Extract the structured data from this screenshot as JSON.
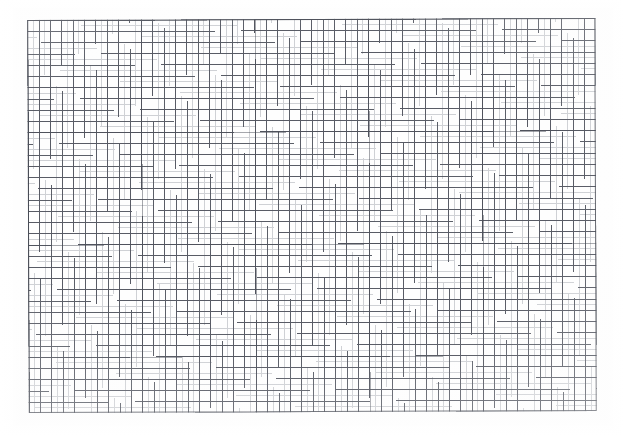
{
  "document": {
    "type": "graph-paper",
    "title": "Blank Graph Paper Sheet",
    "background_color": "#fefefe",
    "has_text": false,
    "has_labels": false,
    "has_annotations": false
  },
  "grid": {
    "name": "plotting-grid",
    "left_px": 28,
    "top_px": 19,
    "width_px": 568,
    "height_px": 393,
    "columns": 50,
    "rows": 35,
    "cell_width_px": 11.36,
    "cell_height_px": 11.23,
    "subdivisions_per_cell": 2,
    "major_every_n_cells": 10,
    "line_color": "#4e525c",
    "minor_line_color": "#787d87",
    "border_color": "#464a54",
    "line_width_px": 0.9,
    "minor_line_width_px": 0.6,
    "border_width_px": 1
  },
  "chart_data": {
    "type": "table",
    "title": "",
    "xlabel": "",
    "ylabel": "",
    "categories": [],
    "values": [],
    "series": [],
    "grid": true,
    "legend": false,
    "annotations": [],
    "note": "Empty grid — no plotted data, axes labels, or tick text present."
  },
  "scan": {
    "rotation_deg": -0.22,
    "paper_tint": "#fefefe",
    "vignette": true
  }
}
